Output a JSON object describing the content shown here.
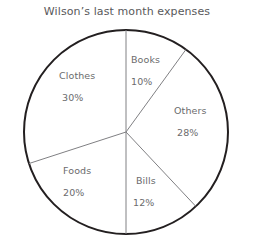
{
  "chart_data": {
    "type": "pie",
    "title": "Wilson’s last month expenses",
    "categories": [
      "Books",
      "Others",
      "Bills",
      "Foods",
      "Clothes"
    ],
    "values": [
      10,
      28,
      12,
      20,
      30
    ],
    "value_suffix": "%",
    "start_angle_deg": 0,
    "direction": "clockwise",
    "legend": "none",
    "grid": false,
    "slices": [
      {
        "label": "Books",
        "value": 10,
        "value_text": "10%",
        "start_deg": 0,
        "end_deg": 36,
        "label_x": 131,
        "label_y": 54,
        "value_x": 131,
        "value_y": 76
      },
      {
        "label": "Others",
        "value": 28,
        "value_text": "28%",
        "start_deg": 36,
        "end_deg": 136.8,
        "label_x": 174,
        "label_y": 105,
        "value_x": 177,
        "value_y": 127
      },
      {
        "label": "Bills",
        "value": 12,
        "value_text": "12%",
        "start_deg": 136.8,
        "end_deg": 180,
        "label_x": 136,
        "label_y": 175,
        "value_x": 133,
        "value_y": 197
      },
      {
        "label": "Foods",
        "value": 20,
        "value_text": "20%",
        "start_deg": 180,
        "end_deg": 252,
        "label_x": 63,
        "label_y": 165,
        "value_x": 63,
        "value_y": 187
      },
      {
        "label": "Clothes",
        "value": 30,
        "value_text": "30%",
        "start_deg": 252,
        "end_deg": 360,
        "label_x": 59,
        "label_y": 70,
        "value_x": 62,
        "value_y": 92
      }
    ],
    "geometry": {
      "center_x": 126,
      "center_y": 132,
      "radius": 102
    },
    "colors": {
      "slice_fill": "#ffffff",
      "outline": "#231f20",
      "divider": "#808083",
      "text": "#6b6b6d",
      "title_text": "#59595b",
      "background": "#ffffff"
    }
  }
}
